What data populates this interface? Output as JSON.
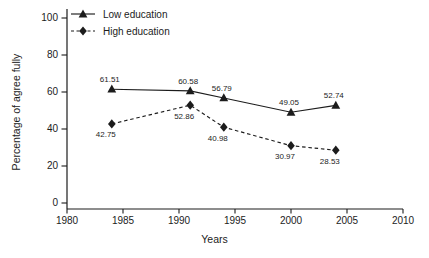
{
  "figure": {
    "background_color": "#ffffff",
    "axis_color": "#1c1c1c",
    "text_color": "#1c1c1c"
  },
  "chart_data": {
    "type": "line",
    "x": [
      1984,
      1991,
      1994,
      2000,
      2004
    ],
    "series": [
      {
        "name": "Low education",
        "values": [
          61.51,
          60.58,
          56.79,
          49.05,
          52.74
        ],
        "marker": "triangle",
        "line_style": "solid",
        "color": "#1c1c1c",
        "label_position": "above"
      },
      {
        "name": "High education",
        "values": [
          42.75,
          52.86,
          40.98,
          30.97,
          28.53
        ],
        "marker": "diamond",
        "line_style": "dashed",
        "color": "#1c1c1c",
        "label_position": "below"
      }
    ],
    "data_labels": [
      "61.51",
      "60.58",
      "56.79",
      "49.05",
      "52.74",
      "42.75",
      "52.86",
      "40.98",
      "30.97",
      "28.53"
    ],
    "title": "",
    "xlabel": "Years",
    "ylabel": "Percentage of agree fully",
    "xlim": [
      1980,
      2010
    ],
    "ylim": [
      0,
      100
    ],
    "xticks": [
      1980,
      1985,
      1990,
      1995,
      2000,
      2005,
      2010
    ],
    "yticks": [
      0,
      20,
      40,
      60,
      80,
      100
    ],
    "grid": false,
    "legend_position": "top-left-inside"
  }
}
